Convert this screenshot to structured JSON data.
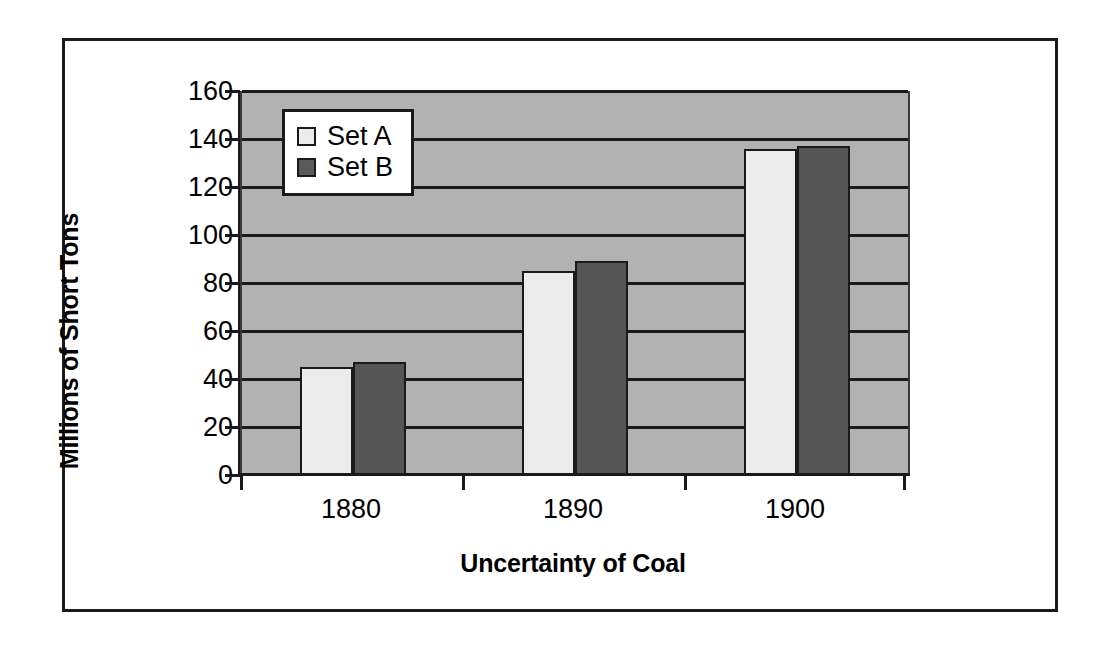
{
  "chart_data": {
    "type": "bar",
    "title": "",
    "xlabel": "Uncertainty of Coal",
    "ylabel": "Millions of Short Tons",
    "categories": [
      "1880",
      "1890",
      "1900"
    ],
    "series": [
      {
        "name": "Set A",
        "values": [
          45,
          85,
          136
        ],
        "color": "#ececec"
      },
      {
        "name": "Set B",
        "values": [
          47,
          89,
          137
        ],
        "color": "#555555"
      }
    ],
    "ylim": [
      0,
      160
    ],
    "ytick_step": 20,
    "yticks": [
      160,
      140,
      120,
      100,
      80,
      60,
      40,
      20,
      0
    ],
    "ytick_labels": [
      "160",
      "140",
      "120",
      "100",
      "80",
      "60",
      "40",
      "20",
      "0"
    ],
    "grid": "horizontal",
    "legend_position": "upper-left-inside",
    "plot_background": "#b2b2b2",
    "gridline_color": "#1a1a1a",
    "frame_color": "#1a1a1a"
  },
  "legend": {
    "entries": [
      {
        "label": "Set A",
        "swatch": "light-gray-square"
      },
      {
        "label": "Set B",
        "swatch": "dark-gray-square"
      }
    ]
  },
  "axes": {
    "y_title": "Millions of Short Tons",
    "x_title": "Uncertainty of Coal"
  }
}
